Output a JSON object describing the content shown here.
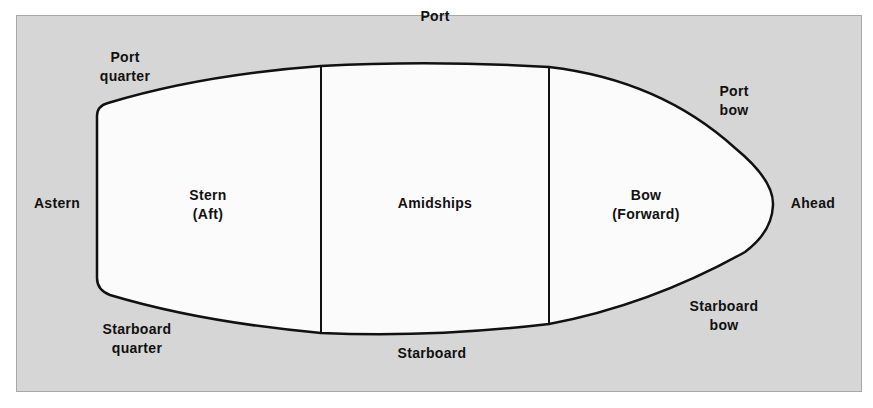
{
  "diagram": {
    "colors": {
      "background": "#d6d6d6",
      "hull_fill": "#fbfbfb",
      "outline": "#111111"
    },
    "sections": [
      {
        "id": "stern",
        "line1": "Stern",
        "line2": "(Aft)"
      },
      {
        "id": "amidships",
        "line1": "Amidships",
        "line2": ""
      },
      {
        "id": "bow",
        "line1": "Bow",
        "line2": "(Forward)"
      }
    ],
    "directions": {
      "port": "Port",
      "starboard": "Starboard",
      "astern": "Astern",
      "ahead": "Ahead",
      "port_quarter": [
        "Port",
        "quarter"
      ],
      "port_bow": [
        "Port",
        "bow"
      ],
      "starboard_quarter": [
        "Starboard",
        "quarter"
      ],
      "starboard_bow": [
        "Starboard",
        "bow"
      ]
    }
  }
}
